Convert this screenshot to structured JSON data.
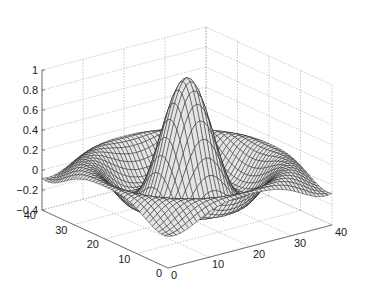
{
  "chart_data": {
    "type": "surface",
    "title": "",
    "function": "sin(R)/R, R = sqrt(X^2 + Y^2) over linspace(-8,8,41)",
    "grid": {
      "x_min": 0,
      "x_max": 40,
      "y_min": 0,
      "y_max": 40,
      "n": 41
    },
    "domain": {
      "u_min": -8,
      "u_max": 8
    },
    "zlim": [
      -0.4,
      1
    ],
    "xlim": [
      0,
      40
    ],
    "ylim": [
      0,
      40
    ],
    "x_ticks": [
      "0",
      "10",
      "20",
      "30",
      "40"
    ],
    "y_ticks": [
      "0",
      "10",
      "20",
      "30",
      "40"
    ],
    "z_ticks": [
      "-0.4",
      "-0.2",
      "0",
      "0.2",
      "0.4",
      "0.6",
      "0.8",
      "1"
    ],
    "grid_on": true,
    "view": "default 3D (az -37.5, el 30)",
    "colors": {
      "face": "#e4e4e4",
      "edge": "#1a1a1a",
      "grid": "#b0b0b0",
      "axis": "#555555"
    }
  }
}
